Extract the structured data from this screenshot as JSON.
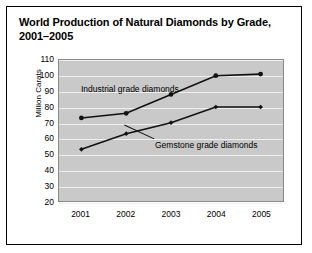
{
  "chart_data": {
    "type": "line",
    "title": "World Production of Natural Diamonds by Grade, 2001–2005",
    "xlabel": "",
    "ylabel": "Million Carats",
    "categories": [
      "2001",
      "2002",
      "2003",
      "2004",
      "2005"
    ],
    "ylim": [
      20,
      110
    ],
    "yticks": [
      110,
      100,
      90,
      80,
      70,
      60,
      50,
      40,
      30,
      20
    ],
    "grid": true,
    "legend_position": "inline-annotations",
    "series": [
      {
        "name": "Industrial grade diamonds",
        "values": [
          73,
          76,
          88,
          100,
          101
        ],
        "marker": "circle",
        "color": "#111111"
      },
      {
        "name": "Gemstone grade diamonds",
        "values": [
          53,
          63,
          70,
          80,
          80
        ],
        "marker": "diamond",
        "color": "#111111"
      }
    ],
    "annotations": [
      {
        "text": "Industrial grade diamonds",
        "series": "Industrial grade diamonds"
      },
      {
        "text": "Gemstone grade diamonds",
        "series": "Gemstone grade diamonds"
      }
    ],
    "colors": {
      "plot_background": "#c9c9c9",
      "gridline": "#efefef",
      "line": "#111111",
      "frame": "#000000"
    }
  }
}
